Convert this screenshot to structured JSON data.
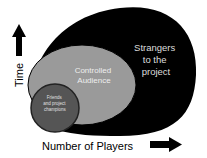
{
  "diagram": {
    "y_axis_label": "Time",
    "x_axis_label": "Number of Players",
    "regions": [
      {
        "label_lines": [
          "Strangers",
          "to the",
          "project"
        ],
        "color": "#000000",
        "text_color": "#dddddd"
      },
      {
        "label_lines": [
          "Controlled",
          "Audience"
        ],
        "color": "#9a9a9a",
        "text_color": "#eeeeee"
      },
      {
        "label_lines": [
          "Friends",
          "and project",
          "champions"
        ],
        "color": "#555555",
        "text_color": "#e0e0e0"
      }
    ]
  }
}
